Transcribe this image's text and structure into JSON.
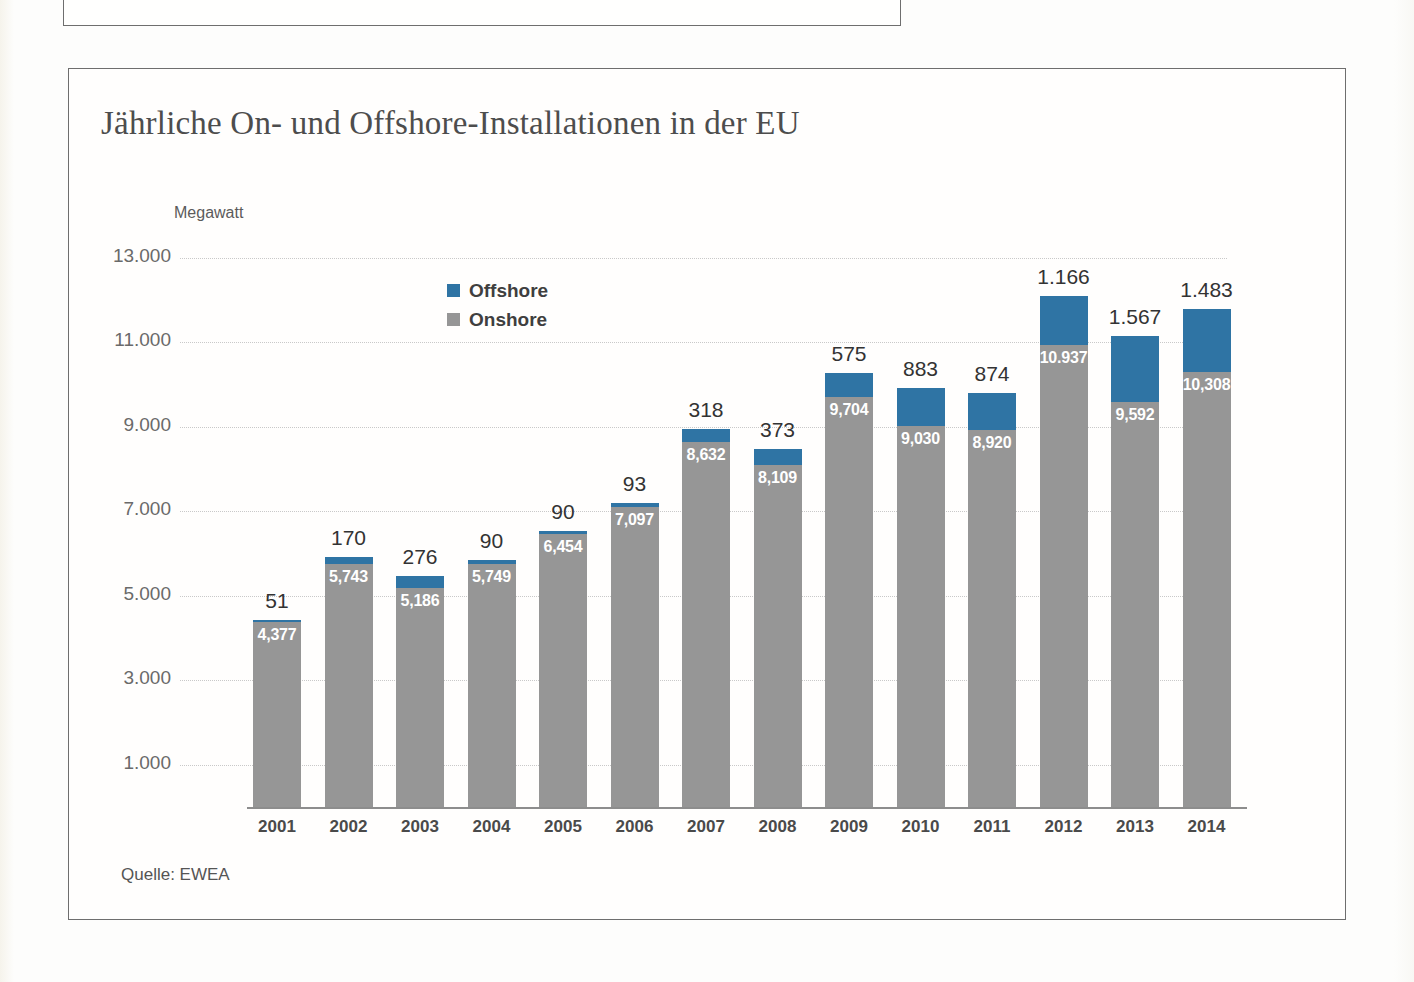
{
  "chart": {
    "title": "Jährliche On- und Offshore-Installationen in der EU",
    "axis_unit": "Megawatt",
    "source": "Quelle: EWEA",
    "colors": {
      "offshore": "#2f74a4",
      "onshore": "#969696",
      "frame": "#6e6e6e",
      "grid": "#c9c9c9",
      "background": "#fdfdfc"
    }
  },
  "legend": {
    "position": "top-left-inside",
    "items": [
      {
        "label": "Offshore",
        "color": "#2f74a4"
      },
      {
        "label": "Onshore",
        "color": "#969696"
      }
    ]
  },
  "chart_data": {
    "type": "bar",
    "stacked": true,
    "title": "Jährliche On- und Offshore-Installationen in der EU",
    "xlabel": "",
    "ylabel": "Megawatt",
    "ylim": [
      0,
      13000
    ],
    "ytick_step": 2000,
    "ytick_labels": [
      "1.000",
      "3.000",
      "5.000",
      "7.000",
      "9.000",
      "11.000",
      "13.000"
    ],
    "ytick_values": [
      1000,
      3000,
      5000,
      7000,
      9000,
      11000,
      13000
    ],
    "grid": true,
    "grid_style": "dotted-horizontal",
    "categories": [
      "2001",
      "2002",
      "2003",
      "2004",
      "2005",
      "2006",
      "2007",
      "2008",
      "2009",
      "2010",
      "2011",
      "2012",
      "2013",
      "2014"
    ],
    "series": [
      {
        "name": "Onshore",
        "color": "#969696",
        "values": [
          4377,
          5743,
          5186,
          5749,
          6454,
          7097,
          8632,
          8109,
          9704,
          9030,
          8920,
          10937,
          9592,
          10308
        ],
        "labels": [
          "4,377",
          "5,743",
          "5,186",
          "5,749",
          "6,454",
          "7,097",
          "8,632",
          "8,109",
          "9,704",
          "9,030",
          "8,920",
          "10.937",
          "9,592",
          "10,308"
        ]
      },
      {
        "name": "Offshore",
        "color": "#2f74a4",
        "values": [
          51,
          170,
          276,
          90,
          90,
          93,
          318,
          373,
          575,
          883,
          874,
          1166,
          1567,
          1483
        ],
        "labels": [
          "51",
          "170",
          "276",
          "90",
          "90",
          "93",
          "318",
          "373",
          "575",
          "883",
          "874",
          "1.166",
          "1.567",
          "1.483"
        ]
      }
    ],
    "totals": [
      4428,
      5913,
      5462,
      5839,
      6544,
      7190,
      8950,
      8482,
      10279,
      9913,
      9794,
      12103,
      11159,
      11791
    ]
  }
}
